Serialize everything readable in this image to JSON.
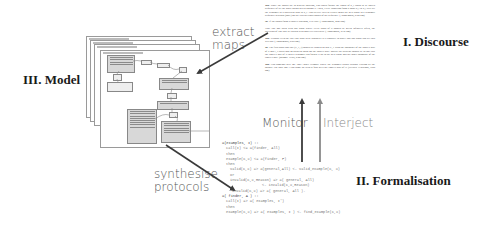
{
  "stages": {
    "discourse": "I. Discourse",
    "formalisation": "II. Formalisation",
    "model": "III. Model"
  },
  "actions": {
    "extract_maps": "extract\nmaps",
    "extract_line1": "extract",
    "extract_line2": "maps",
    "synthesise_line1": "synthesise",
    "synthesise_line2": "protocols",
    "monitor": "Monitor",
    "interject": "Interject"
  },
  "discourse_document": {
    "paragraphs": [
      {
        "id": "18a",
        "text": "Since the points are in general position, you could follow the chord of p_i chain to be sorted sequence of all the other points given around it. Then, every transition from a point p_i to p_j will set the windmill to a particular spot to p_j. This device tries to clearly mark the next point in a windmill sequence depends (only) on the two previous points of the sequence. (Anonymous, 8:52 pm)"
      },
      {
        "id": "3b",
        "text": "If the points form a convex polygon, it is easy. (Anonymous, 4:06 pm)"
      },
      {
        "id": "",
        "text": "Take line one such with any point where every point of S should be given infinitely often, the direction of line that we obtain with however traversed. (Anonymous, 8:38 pm)"
      },
      {
        "id": "18b",
        "text": "Perhaps even the line you want to be dropped? Is it possible to prove that any point can see this will do? (Anonymous, 8:55 pm)"
      },
      {
        "id": "4a",
        "text": "The first point and line (P_1, l) should be chosen so that P_1 is on the boundary of the convex hull of S and l_1 splits into an adjacent point on the convex hull. Maybe the strategy should be to take just the convex hull of S then a windmill can follow it up to the next point and the other boundary of the convex hull. (Maggie Yeats, 5:06 pm)"
      },
      {
        "id": "18b",
        "text": "Can someone give me \"one\" other example where the windmill works without visiting all the points? The only one I can come up with is four over the convex hull of S. (Delbert Yearwood, 9:08 pm)"
      }
    ]
  },
  "formalisation_code": [
    {
      "indent": 0,
      "text": "a(examples, I) ::"
    },
    {
      "indent": 1,
      "text": "call(I) <= a(finder, All)"
    },
    {
      "indent": 1,
      "text": "then"
    },
    {
      "indent": 1,
      "text": "example(C,X) <= a(finder, F)"
    },
    {
      "indent": 1,
      "text": "then"
    },
    {
      "indent": 2,
      "text": "valid(C,X) => a(general,All) <- valid_example(C, X)"
    },
    {
      "indent": 2,
      "text": "or"
    },
    {
      "indent": 2,
      "text": "invalid(C,X,Reason) => a( general, All)"
    },
    {
      "indent": 6,
      "text": "<- invalid(C,X,Reason)"
    },
    {
      "indent": 0,
      "text": ""
    },
    {
      "indent": 2,
      "text": "invalid(C,X) => a( general, All )."
    },
    {
      "indent": 0,
      "text": ""
    },
    {
      "indent": 0,
      "text": "a( finder, A ) ::"
    },
    {
      "indent": 1,
      "text": "call(I) => a( examples, I')"
    },
    {
      "indent": 1,
      "text": "then"
    },
    {
      "indent": 1,
      "text": "example(C,X) => a( examples, I ) <- find_example(C,X)"
    }
  ],
  "model_panels": {
    "stack_count": 4
  },
  "colors": {
    "arrow_dark": "#3a3a3a",
    "arrow_light": "#8a8a8a",
    "stage_text": "#1a1a1a",
    "action_text": "#555555"
  }
}
